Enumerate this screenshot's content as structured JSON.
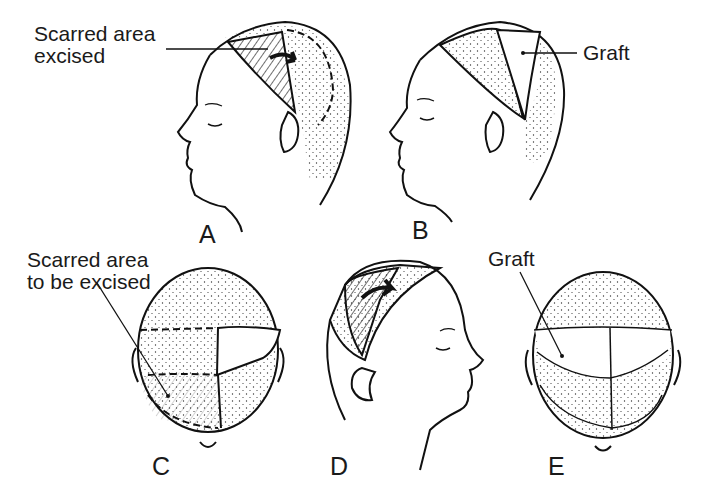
{
  "figure": {
    "panels": [
      {
        "id": "A",
        "letter": "A",
        "view": "left profile",
        "callout": {
          "line1": "Scarred area",
          "line2": "excised"
        }
      },
      {
        "id": "B",
        "letter": "B",
        "view": "left profile",
        "callout": {
          "line1": "Graft"
        }
      },
      {
        "id": "C",
        "letter": "C",
        "view": "top of head",
        "callout": {
          "line1": "Scarred area",
          "line2": "to be excised"
        }
      },
      {
        "id": "D",
        "letter": "D",
        "view": "right profile"
      },
      {
        "id": "E",
        "letter": "E",
        "view": "top of head",
        "callout": {
          "line1": "Graft"
        }
      }
    ]
  }
}
